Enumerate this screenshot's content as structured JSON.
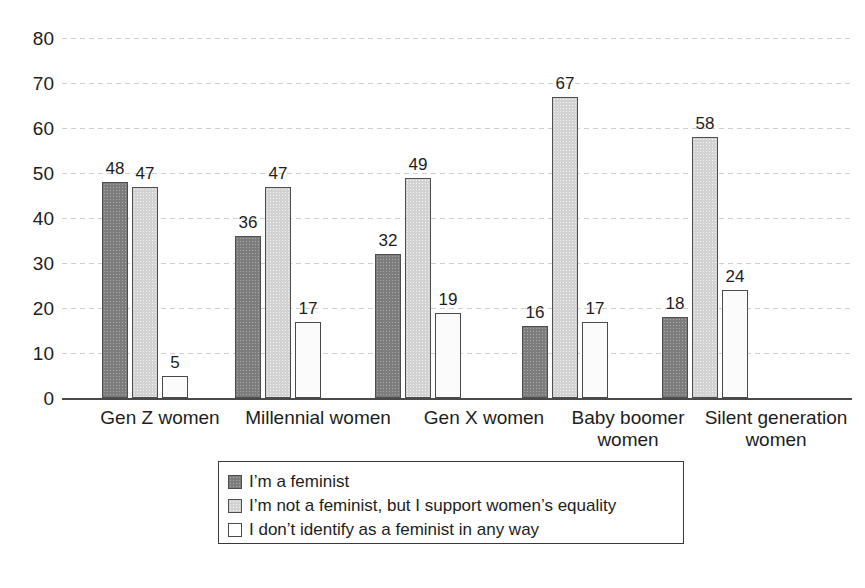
{
  "chart_data": {
    "type": "bar",
    "title": "",
    "subtitle": "",
    "xlabel": "",
    "ylabel": "",
    "ylim": [
      0,
      80
    ],
    "yticks": [
      0,
      10,
      20,
      30,
      40,
      50,
      60,
      70,
      80
    ],
    "grid": true,
    "legend_position": "bottom",
    "categories": [
      "Gen Z women",
      "Millennial women",
      "Gen X women",
      "Baby boomer\nwomen",
      "Silent generation\nwomen"
    ],
    "series": [
      {
        "name": "I’m a feminist",
        "color": "#7d7d7d",
        "values": [
          48,
          36,
          32,
          16,
          18
        ]
      },
      {
        "name": "I’m not a feminist, but I support women’s equality",
        "color": "#d2d2d2",
        "values": [
          47,
          47,
          49,
          67,
          58
        ]
      },
      {
        "name": "I don’t identify as a feminist in any way",
        "color": "#fbfbfb",
        "values": [
          5,
          17,
          19,
          17,
          24
        ]
      }
    ]
  },
  "axis": {
    "y_tick_labels": [
      "80",
      "70",
      "60",
      "50",
      "40",
      "30",
      "20",
      "10",
      "0"
    ]
  },
  "legend": {
    "items": [
      {
        "label": "I’m a feminist",
        "swatch": "dark-gray-swatch"
      },
      {
        "label": "I’m not a feminist, but I support women’s equality",
        "swatch": "light-gray-swatch"
      },
      {
        "label": "I don’t identify as a feminist in any way",
        "swatch": "white-swatch"
      }
    ]
  }
}
